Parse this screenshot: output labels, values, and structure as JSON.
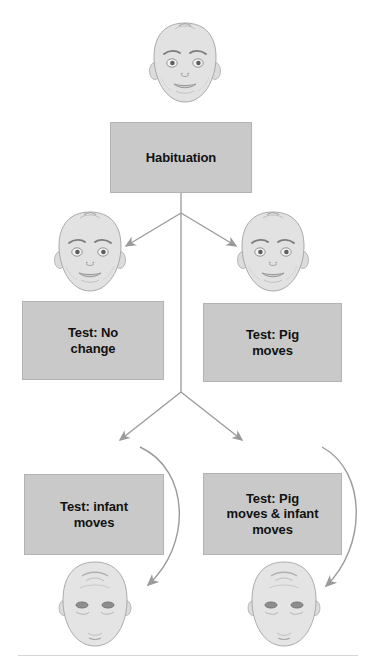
{
  "figure": {
    "background_color": "#ffffff",
    "box_fill_color": "#c9c9c9",
    "box_border_color": "#b3b3b3",
    "arrow_color": "#9a9a9a",
    "text_color": "#111111",
    "rule_color": "#d4d4d4"
  },
  "boxes": {
    "habituation": {
      "label": "Habituation",
      "icon": "pig-icon",
      "icon_position": "top-left"
    },
    "test_no_change": {
      "label": "Test: No\nchange",
      "icon": "pig-icon",
      "icon_position": "top-left"
    },
    "test_pig_moves": {
      "label": "Test: Pig\nmoves",
      "icon": "pig-icon",
      "icon_position": "bottom-right"
    },
    "test_infant_moves": {
      "label": "Test: infant\nmoves",
      "icon": "pig-icon",
      "icon_position": "top-left"
    },
    "test_pig_and_infant_moves": {
      "label": "Test: Pig\nmoves & infant\nmoves",
      "icon": "pig-icon",
      "icon_position": "bottom-right"
    }
  },
  "faces": {
    "habituation_infant": {
      "name": "infant-face-upright",
      "orientation": "upright"
    },
    "test_left_infant": {
      "name": "infant-face-upright",
      "orientation": "upright"
    },
    "test_right_infant": {
      "name": "infant-face-upright",
      "orientation": "upright"
    },
    "bottom_left_infant": {
      "name": "infant-face-tilted-back",
      "orientation": "tilted-back"
    },
    "bottom_right_infant": {
      "name": "infant-face-tilted-back",
      "orientation": "tilted-back"
    }
  },
  "arrows": {
    "branch_one": {
      "from": "habituation",
      "to": [
        "test_no_change",
        "test_pig_moves"
      ],
      "style": "straight"
    },
    "branch_two": {
      "from": "habituation",
      "to": [
        "test_infant_moves",
        "test_pig_and_infant_moves"
      ],
      "style": "straight"
    },
    "curve_left": {
      "from": "test_infant_moves_branch",
      "to": "bottom_left_infant",
      "style": "curved"
    },
    "curve_right": {
      "from": "test_pig_and_infant_moves_branch",
      "to": "bottom_right_infant",
      "style": "curved"
    }
  }
}
